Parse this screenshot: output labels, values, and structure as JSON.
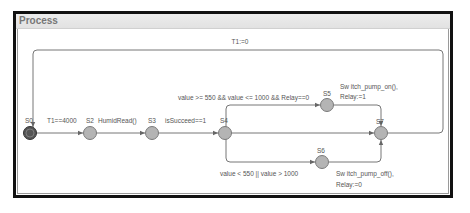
{
  "window": {
    "title": "Process"
  },
  "nodes": [
    {
      "id": "S0",
      "label": "S0",
      "initial": true
    },
    {
      "id": "S2",
      "label": "S2"
    },
    {
      "id": "S3",
      "label": "S3"
    },
    {
      "id": "S4",
      "label": "S4"
    },
    {
      "id": "S5",
      "label": "S5"
    },
    {
      "id": "S6",
      "label": "S6"
    },
    {
      "id": "S7",
      "label": "S7"
    }
  ],
  "edges": {
    "s0_s2_guard": "T1==4000",
    "s2_s3_action": "HumidRead()",
    "s3_s4_guard": "isSucceed==1",
    "s4_s5_guard": "value >= 550 && value <= 1000 && Relay==0",
    "s5_s7_action_1": "Sw itch_pump_on(),",
    "s5_s7_action_2": "Relay:=1",
    "s4_s6_guard": "value < 550 || value > 1000",
    "s6_s7_action_1": "Sw itch_pump_off(),",
    "s6_s7_action_2": "Relay:=0",
    "s7_s0_reset": "T1:=0"
  },
  "colors": {
    "node_fill": "#b4b4b4",
    "node_stroke": "#7a7a7a",
    "initial_fill": "#555555",
    "edge": "#777777",
    "frame": "#111111"
  }
}
